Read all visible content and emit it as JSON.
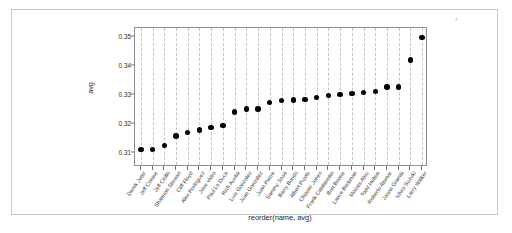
{
  "chart_data": {
    "type": "scatter",
    "title": "",
    "xlabel": "reorder(name, avg)",
    "ylabel": "avg",
    "ylim": [
      0.305,
      0.353
    ],
    "yticks": [
      0.31,
      0.32,
      0.33,
      0.34,
      0.35
    ],
    "ytick_labels": [
      "0.31",
      "0.32",
      "0.33",
      "0.34",
      "0.35"
    ],
    "grid": "vertical-dashed",
    "legend": "none",
    "point_color": "#000000",
    "categories": [
      "Derek Jeter",
      "Jeff Conine",
      "Jeff Cirillo",
      "Shannon Stewart",
      "Cliff Floyd",
      "Alex Rodriguez",
      "Jose Vidro",
      "Paul Lo Duca",
      "Rich Aurilia",
      "Luis Gonzalez",
      "Juan Gonzalez",
      "Juan Pierre",
      "Sammy Sosa",
      "Barry Bonds",
      "Albert Pujols",
      "Chipper Jones",
      "Frank Catalanotto",
      "Bret Boone",
      "Lance Berkman",
      "Moises Alou",
      "Todd Helton",
      "Roberto Alomar",
      "Jason Giambi",
      "Ichiro Suzuki",
      "Larry Walker"
    ],
    "values": [
      0.311,
      0.311,
      0.3125,
      0.3157,
      0.317,
      0.3178,
      0.3187,
      0.3194,
      0.324,
      0.325,
      0.325,
      0.3272,
      0.328,
      0.3282,
      0.3284,
      0.329,
      0.3296,
      0.33,
      0.3303,
      0.3307,
      0.331,
      0.3326,
      0.3326,
      0.342,
      0.3497
    ]
  }
}
